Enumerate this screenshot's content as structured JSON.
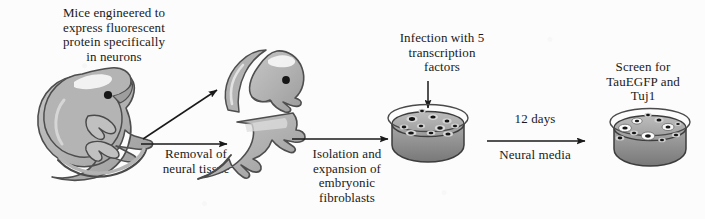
{
  "figure": {
    "background_color": "#fcfcfc",
    "ink_color": "#1a1a1a",
    "fill_gray": "#b2b2b2",
    "fill_gray_dark": "#8e8e8e",
    "fill_gray_light": "#d2d2d2"
  },
  "captions": {
    "mice": "Mice engineered to\nexpress fluorescent\nprotein specifically\nin neurons",
    "removal": "Removal of\nneural tissue",
    "isolation": "Isolation and\nexpansion of\nembryonic\nfibroblasts",
    "infection": "Infection with 5\ntranscription\nfactors",
    "days": "12 days",
    "media": "Neural media",
    "screen": "Screen for\nTauEGFP and\nTuj1"
  },
  "steps": [
    {
      "id": "embryo",
      "label": "fluorescent-reporter mouse embryo"
    },
    {
      "id": "dissected-head",
      "label": "dissected head and neural tissue"
    },
    {
      "id": "headless-body",
      "label": "headless embryo body"
    },
    {
      "id": "fibroblast-dish",
      "label": "petri dish of embryonic fibroblasts"
    },
    {
      "id": "neuron-dish",
      "label": "petri dish with reprogrammed neurons"
    }
  ],
  "arrows": [
    {
      "id": "embryo-to-head",
      "direction": "up-right"
    },
    {
      "id": "embryo-to-body",
      "direction": "right"
    },
    {
      "id": "body-to-dish",
      "direction": "right"
    },
    {
      "id": "infection",
      "direction": "down"
    },
    {
      "id": "dish-to-dish",
      "direction": "right"
    }
  ]
}
